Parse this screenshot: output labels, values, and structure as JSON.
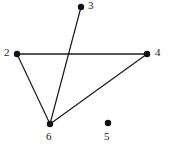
{
  "figure": {
    "kind": "undirected-graph-drawing",
    "width": 169,
    "height": 150,
    "background_color": "#ffffff"
  },
  "style": {
    "node_color": "#111111",
    "node_radius": 3.2,
    "edge_color": "#1a1a1a",
    "edge_color_light": "#555555",
    "edge_width": 1.2,
    "edge_width_thick": 1.8,
    "label_color": "#1a1a1a",
    "label_font_size": 11
  },
  "graph": {
    "nodes": [
      {
        "id": "3",
        "label": "3",
        "x": 81,
        "y": 7,
        "label_x": 88,
        "label_y": 0,
        "label_align": "left"
      },
      {
        "id": "2",
        "label": "2",
        "x": 17,
        "y": 54,
        "label_x": 4,
        "label_y": 47,
        "label_align": "left"
      },
      {
        "id": "4",
        "label": "4",
        "x": 147,
        "y": 54,
        "label_x": 155,
        "label_y": 47,
        "label_align": "left"
      },
      {
        "id": "6",
        "label": "6",
        "x": 50,
        "y": 124,
        "label_x": 46,
        "label_y": 131,
        "label_align": "left"
      },
      {
        "id": "5",
        "label": "5",
        "x": 108,
        "y": 123,
        "label_x": 104,
        "label_y": 131,
        "label_align": "left"
      }
    ],
    "edges": [
      {
        "source": "2",
        "target": "4",
        "weight": "thick"
      },
      {
        "source": "2",
        "target": "6",
        "weight": "normal"
      },
      {
        "source": "3",
        "target": "6",
        "weight": "normal"
      },
      {
        "source": "6",
        "target": "4",
        "weight": "normal"
      }
    ],
    "isolated_nodes": [
      "5"
    ]
  }
}
